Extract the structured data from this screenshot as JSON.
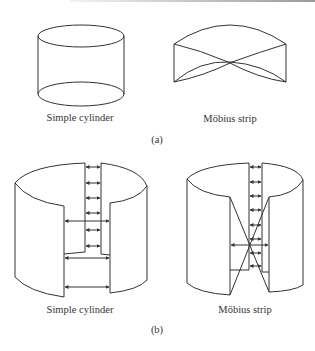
{
  "figure": {
    "part_a": {
      "label": "(a)",
      "left_caption": "Simple cylinder",
      "right_caption": "Möbius strip"
    },
    "part_b": {
      "label": "(b)",
      "left_caption": "Simple cylinder",
      "right_caption": "Möbius strip"
    }
  },
  "colors": {
    "stroke": "#333333",
    "background": "#ffffff"
  }
}
